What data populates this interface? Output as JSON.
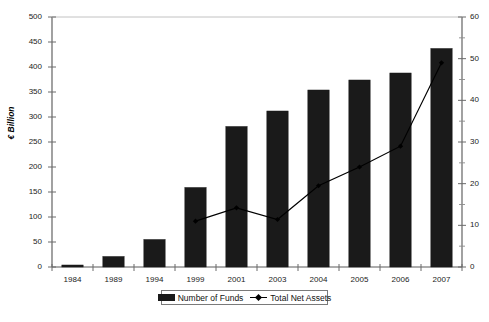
{
  "chart_data": {
    "type": "bar",
    "title": "",
    "subtitle": "",
    "xlabel": "",
    "ylabel": "€ Billion",
    "y2label": "",
    "categories": [
      "1984",
      "1989",
      "1994",
      "1999",
      "2001",
      "2003",
      "2004",
      "2005",
      "2006",
      "2007"
    ],
    "ylim": [
      0,
      500
    ],
    "y2lim": [
      0,
      60
    ],
    "yticks": [
      0,
      50,
      100,
      150,
      200,
      250,
      300,
      350,
      400,
      450,
      500
    ],
    "y2ticks": [
      0,
      10,
      20,
      30,
      40,
      50,
      60
    ],
    "y2minorticks": [
      5,
      15,
      25,
      35,
      45,
      55
    ],
    "grid": false,
    "legend_position": "bottom",
    "series": [
      {
        "name": "Number of Funds",
        "type": "bar",
        "axis": "left",
        "color": "#1a1a1a",
        "values": [
          4,
          21,
          55,
          159,
          281,
          312,
          354,
          374,
          388,
          437
        ]
      },
      {
        "name": "Total Net Assets",
        "type": "line",
        "axis": "right",
        "color": "#000000",
        "values": [
          null,
          null,
          null,
          11,
          14.2,
          11.4,
          19.5,
          24,
          29,
          49
        ]
      }
    ]
  },
  "axes": {
    "left_title": "€ Billion",
    "left_ticks": [
      "0",
      "50",
      "100",
      "150",
      "200",
      "250",
      "300",
      "350",
      "400",
      "450",
      "500"
    ],
    "right_ticks": [
      "0",
      "10",
      "20",
      "30",
      "40",
      "50",
      "60"
    ],
    "category_ticks": [
      "1984",
      "1989",
      "1994",
      "1999",
      "2001",
      "2003",
      "2004",
      "2005",
      "2006",
      "2007"
    ]
  },
  "legend": {
    "items": [
      {
        "label": "Number of Funds",
        "marker": "bar-swatch"
      },
      {
        "label": "Total Net Assets",
        "marker": "line-diamond-marker"
      }
    ]
  }
}
